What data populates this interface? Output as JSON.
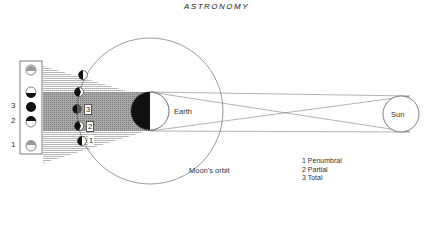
{
  "title": "ASTRONOMY",
  "labels": {
    "earth": "Earth",
    "sun": "Sun",
    "moons_orbit": "Moon's orbit"
  },
  "panel_numbers": [
    "3",
    "2",
    "1"
  ],
  "shadow_tags": [
    "3",
    "2",
    "1"
  ],
  "legend": {
    "items": [
      "1 Penumbral",
      "2 Partial",
      "3 Total"
    ]
  },
  "colors": {
    "line": "#555555",
    "umbra": "#9a9a9a",
    "penumbra_stripe": "#cfcfcf",
    "dark": "#111111"
  }
}
